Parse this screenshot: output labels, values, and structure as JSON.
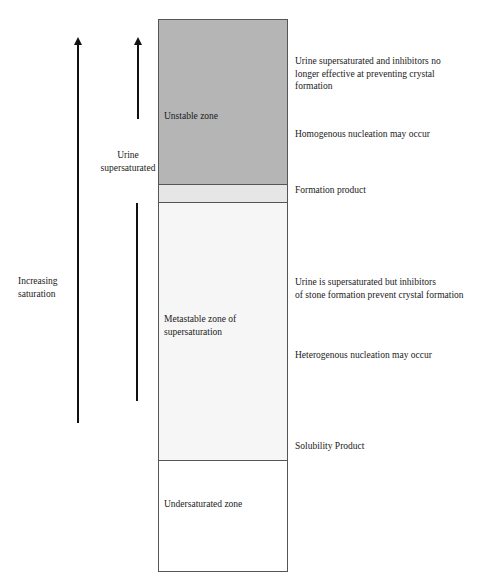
{
  "diagram": {
    "left_labels": {
      "increasing_saturation": "Increasing\nsaturation",
      "urine_supersaturated": "Urine\nsupersaturated"
    },
    "zones": [
      {
        "name": "unstable",
        "label": "Unstable zone",
        "color": "#b5b5b5"
      },
      {
        "name": "formation",
        "label": "",
        "color": "#e6e6e6"
      },
      {
        "name": "metastable",
        "label": "Metastable zone of\nsupersaturation",
        "color": "#f6f6f6"
      },
      {
        "name": "undersaturated",
        "label": "Undersaturated zone",
        "color": "#ffffff"
      }
    ],
    "right_annotations": {
      "unstable_desc": "Urine supersaturated and inhibitors no\nlonger effective at preventing crystal\nformation",
      "homogenous": "Homogenous nucleation may occur",
      "formation_product": "Formation product",
      "metastable_desc": "Urine is supersaturated but inhibitors\nof stone formation prevent crystal formation",
      "heterogenous": "Heterogenous nucleation may occur",
      "solubility_product": "Solubility Product"
    }
  }
}
